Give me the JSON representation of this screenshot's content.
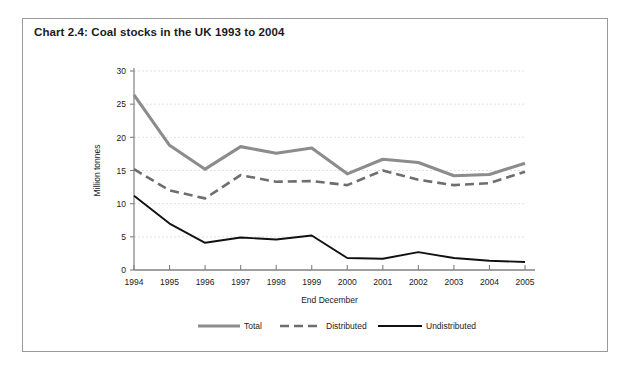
{
  "chart_data": {
    "type": "line",
    "title": "Chart 2.4: Coal stocks in the UK 1993 to 2004",
    "xlabel": "End December",
    "ylabel": "Million tonnes",
    "categories": [
      "1994",
      "1995",
      "1996",
      "1997",
      "1998",
      "1999",
      "2000",
      "2001",
      "2002",
      "2003",
      "2004",
      "2005"
    ],
    "x": [
      1994,
      1995,
      1996,
      1997,
      1998,
      1999,
      2000,
      2001,
      2002,
      2003,
      2004,
      2005
    ],
    "series": [
      {
        "name": "Total",
        "style": "solid-thick-gray",
        "color": "#8c8c8c",
        "values": [
          26.4,
          18.8,
          15.2,
          18.6,
          17.6,
          18.4,
          14.5,
          16.7,
          16.2,
          14.2,
          14.4,
          16.1
        ]
      },
      {
        "name": "Distributed",
        "style": "dashed-gray",
        "color": "#6e6e6e",
        "values": [
          15.2,
          12.0,
          10.8,
          14.3,
          13.3,
          13.4,
          12.8,
          15.0,
          13.6,
          12.8,
          13.1,
          14.8
        ]
      },
      {
        "name": "Undistributed",
        "style": "solid-thin-black",
        "color": "#111111",
        "values": [
          11.2,
          7.0,
          4.1,
          4.9,
          4.6,
          5.2,
          1.8,
          1.7,
          2.7,
          1.8,
          1.4,
          1.2
        ]
      }
    ],
    "ylim": [
      0,
      30
    ],
    "yticks": [
      0,
      5,
      10,
      15,
      20,
      25,
      30
    ],
    "ytick_labels": [
      "0",
      "5",
      "10",
      "15",
      "20",
      "25",
      "30"
    ],
    "grid": true,
    "grid_axis": "y",
    "legend_position": "bottom",
    "legend": [
      "Total",
      "Distributed",
      "Undistributed"
    ]
  },
  "colors": {
    "frame_border": "#9a9a9a",
    "gridline": "#d9d9d9",
    "axis": "#808080",
    "text": "#1a1a1a",
    "background": "#ffffff"
  }
}
